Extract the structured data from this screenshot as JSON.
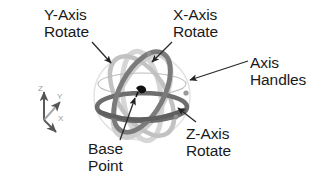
{
  "figure": {
    "type": "technical-diagram",
    "background_color": "#ffffff",
    "text_color": "#1a1a1a"
  },
  "callouts": [
    {
      "id": "y-axis-rotate",
      "line1": "Y-Axis",
      "line2": "Rotate",
      "points_to": "upper-left rotation ring"
    },
    {
      "id": "x-axis-rotate",
      "line1": "X-Axis",
      "line2": "Rotate",
      "points_to": "upper tilted rotation ring"
    },
    {
      "id": "axis-handles",
      "line1": "Axis",
      "line2": "Handles",
      "points_to": "ring handle on right side of sphere"
    },
    {
      "id": "z-axis-rotate",
      "line1": "Z-Axis",
      "line2": "Rotate",
      "points_to": "lower-right horizontal equator ring"
    },
    {
      "id": "base-point",
      "line1": "Base",
      "line2": "Point",
      "points_to": "center origin marker of gizmo"
    }
  ],
  "axis_triad": {
    "z_label": "Z",
    "y_label": "Y",
    "x_label": "X",
    "color_primary": "#5a5a5a",
    "color_secondary": "#b4b4b4"
  },
  "gizmo": {
    "ring_dark_color": "#6f6f6f",
    "ring_mid_color": "#a8a8a8",
    "ring_light_color": "#d2d2d2",
    "base_point_color": "#111111",
    "leader_line_color": "#333333"
  }
}
